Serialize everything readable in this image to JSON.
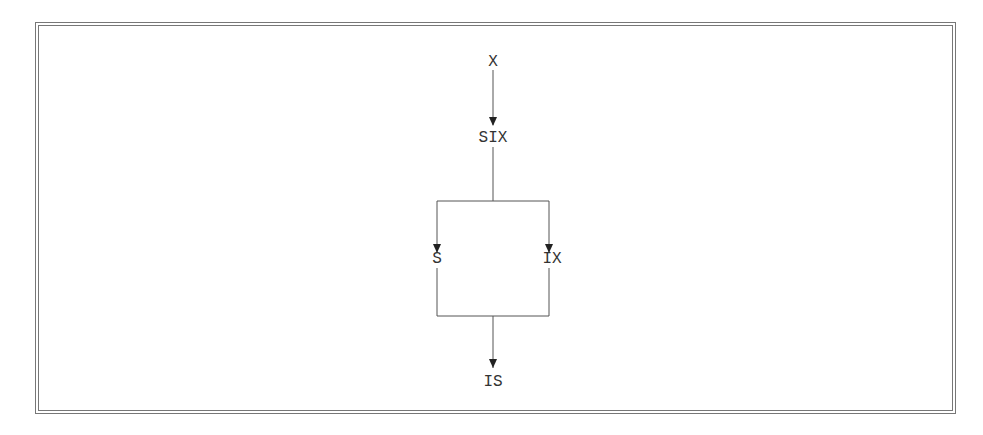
{
  "diagram": {
    "type": "flowchart",
    "nodes": [
      {
        "id": "n1",
        "label": "X"
      },
      {
        "id": "n2",
        "label": "SIX"
      },
      {
        "id": "n3",
        "label": "S"
      },
      {
        "id": "n4",
        "label": "IX"
      },
      {
        "id": "n5",
        "label": "IS"
      }
    ],
    "edges": [
      {
        "from": "n1",
        "to": "n2"
      },
      {
        "from": "n2",
        "to": "n3"
      },
      {
        "from": "n2",
        "to": "n4"
      },
      {
        "from": "n3",
        "to": "n5"
      },
      {
        "from": "n4",
        "to": "n5"
      }
    ],
    "colors": {
      "line": "#555555",
      "text": "#333333",
      "border": "#777777"
    }
  }
}
